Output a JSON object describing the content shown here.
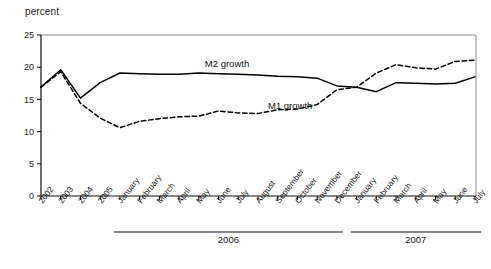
{
  "axis": {
    "ylabel": "percent",
    "yticks": [
      "0",
      "5",
      "10",
      "15",
      "20",
      "25"
    ]
  },
  "series_labels": {
    "m2": "M2 growth",
    "m1": "M1 growth"
  },
  "groups": [
    {
      "label": "2006"
    },
    {
      "label": "2007"
    }
  ],
  "source": {
    "text": ""
  },
  "chart_data": {
    "type": "line",
    "title": "",
    "xlabel": "",
    "ylabel": "percent",
    "ylim": [
      0,
      25
    ],
    "yticks": [
      0,
      5,
      10,
      15,
      20,
      25
    ],
    "grid": false,
    "legend": "inline-annotation",
    "categories": [
      "2002",
      "2003",
      "2004",
      "2005",
      "January",
      "February",
      "March",
      "April",
      "May",
      "June",
      "July",
      "August",
      "September",
      "October",
      "November",
      "December",
      "January",
      "February",
      "March",
      "April",
      "May",
      "June",
      "July"
    ],
    "group_spans": [
      {
        "label": "2006",
        "from": "January",
        "to": "December",
        "start_index": 4,
        "end_index": 15
      },
      {
        "label": "2007",
        "from": "January",
        "to": "July",
        "start_index": 16,
        "end_index": 22
      }
    ],
    "series": [
      {
        "name": "M2 growth",
        "style": "solid",
        "color": "#000000",
        "values": [
          16.9,
          19.6,
          15.2,
          17.6,
          19.1,
          19.0,
          18.9,
          18.9,
          19.1,
          19.0,
          18.9,
          18.8,
          18.6,
          18.5,
          18.3,
          17.1,
          16.9,
          16.2,
          17.6,
          17.5,
          17.4,
          17.5,
          18.5
        ]
      },
      {
        "name": "M1 growth",
        "style": "dashed",
        "color": "#000000",
        "values": [
          16.9,
          19.3,
          14.4,
          12.1,
          10.6,
          11.6,
          12.0,
          12.3,
          12.4,
          13.2,
          12.9,
          12.8,
          13.4,
          13.5,
          14.2,
          16.5,
          16.9,
          19.1,
          20.4,
          19.9,
          19.7,
          20.9,
          21.1
        ]
      }
    ],
    "annotations": [
      {
        "text": "M2 growth",
        "near_category": "May",
        "value": 19.1
      },
      {
        "text": "M1 growth",
        "near_category": "August",
        "value": 13.0
      }
    ]
  }
}
